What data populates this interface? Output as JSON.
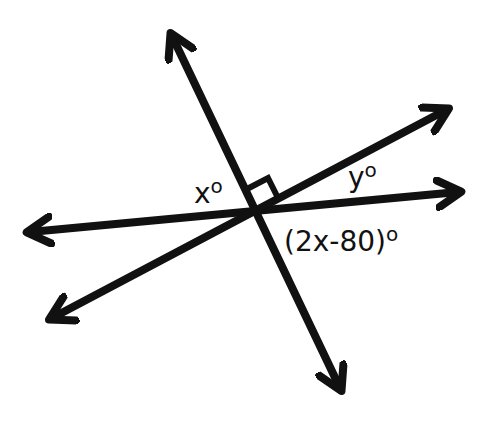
{
  "diagram": {
    "type": "intersecting-lines-angles",
    "stroke_color": "#111111",
    "background": "#ffffff",
    "lines": [
      {
        "name": "line-a",
        "from": [
          172,
          36
        ],
        "to": [
          340,
          388
        ]
      },
      {
        "name": "line-b",
        "from": [
          30,
          232
        ],
        "to": [
          458,
          192
        ]
      },
      {
        "name": "line-c",
        "from": [
          52,
          318
        ],
        "to": [
          446,
          110
        ]
      }
    ],
    "intersection": [
      257,
      210
    ],
    "right_angle_marker": true,
    "labels": {
      "x": {
        "text": "x",
        "degree": "o"
      },
      "y": {
        "text": "y",
        "degree": "o"
      },
      "expr": {
        "text": "(2x-80)",
        "degree": "o"
      }
    }
  }
}
